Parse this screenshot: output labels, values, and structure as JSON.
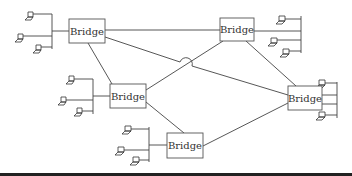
{
  "diagram": {
    "type": "network-topology",
    "bridges": [
      {
        "id": "bridge-top-left",
        "label": "Bridge",
        "x": 69,
        "y": 19,
        "w": 36,
        "h": 24,
        "hosts": 3,
        "side": "left"
      },
      {
        "id": "bridge-top-right",
        "label": "Bridge",
        "x": 220,
        "y": 18,
        "w": 34,
        "h": 23,
        "hosts": 3,
        "side": "right"
      },
      {
        "id": "bridge-middle-left",
        "label": "Bridge",
        "x": 110,
        "y": 84,
        "w": 36,
        "h": 24,
        "hosts": 3,
        "side": "left"
      },
      {
        "id": "bridge-middle-right",
        "label": "Bridge",
        "x": 288,
        "y": 86,
        "w": 34,
        "h": 24,
        "hosts": 3,
        "side": "right"
      },
      {
        "id": "bridge-bottom",
        "label": "Bridge",
        "x": 167,
        "y": 133,
        "w": 36,
        "h": 25,
        "hosts": 3,
        "side": "left"
      }
    ],
    "links": [
      [
        "bridge-top-left",
        "bridge-top-right"
      ],
      [
        "bridge-top-left",
        "bridge-middle-left"
      ],
      [
        "bridge-top-left",
        "bridge-middle-right"
      ],
      [
        "bridge-top-right",
        "bridge-middle-left"
      ],
      [
        "bridge-top-right",
        "bridge-middle-right"
      ],
      [
        "bridge-middle-left",
        "bridge-bottom"
      ],
      [
        "bridge-bottom",
        "bridge-middle-right"
      ]
    ],
    "colors": {
      "line": "#444444",
      "box_border": "#555555",
      "text": "#333333",
      "footer_bar": "#222222"
    }
  }
}
